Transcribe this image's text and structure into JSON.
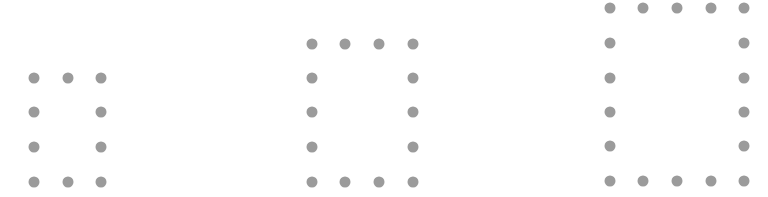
{
  "diagram": {
    "dot_color": "#9b9b9b",
    "dot_radius": 5.5,
    "figures": [
      {
        "name": "pattern-1",
        "columns": 3,
        "rows": 4,
        "dot_count": 10,
        "xs": [
          34,
          68,
          101
        ],
        "ys": [
          78,
          112,
          147,
          182
        ]
      },
      {
        "name": "pattern-2",
        "columns": 4,
        "rows": 5,
        "dot_count": 14,
        "xs": [
          312,
          345,
          379,
          413
        ],
        "ys": [
          44,
          78,
          112,
          147,
          182
        ]
      },
      {
        "name": "pattern-3",
        "columns": 5,
        "rows": 6,
        "dot_count": 18,
        "xs": [
          610,
          643,
          677,
          711,
          744
        ],
        "ys": [
          8,
          43,
          78,
          112,
          146,
          181
        ]
      }
    ]
  }
}
